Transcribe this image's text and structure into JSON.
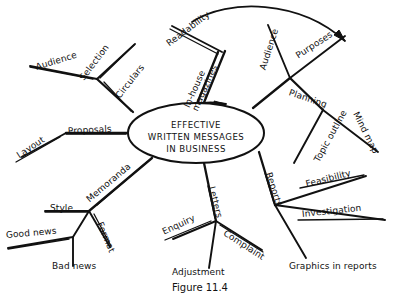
{
  "figure": {
    "caption": "Figure 11.4",
    "caption_x": 172,
    "caption_y": 282
  },
  "center": {
    "name": "center-node",
    "line1": "EFFECTIVE",
    "line2": "WRITTEN MESSAGES",
    "line3": "IN BUSINESS",
    "cx": 196,
    "cy": 133,
    "rx": 68,
    "ry": 30
  },
  "colors": {
    "ink": "#111111",
    "background": "#ffffff"
  },
  "branches": [
    {
      "id": "circulars",
      "label": "Circulars",
      "x": 118,
      "y": 93,
      "rot": -52,
      "underline": true,
      "children": [
        {
          "id": "audience-circulars",
          "label": "Audience",
          "x": 36,
          "y": 63,
          "rot": -17,
          "underline": true
        },
        {
          "id": "selection",
          "label": "Selection",
          "x": 82,
          "y": 75,
          "rot": -53,
          "underline": true
        }
      ]
    },
    {
      "id": "proposals",
      "label": "Proposals",
      "x": 68,
      "y": 127,
      "rot": -3,
      "underline": true,
      "children": [
        {
          "id": "layout",
          "label": "Layout",
          "x": 18,
          "y": 152,
          "rot": -34,
          "underline": true
        }
      ]
    },
    {
      "id": "memoranda",
      "label": "Memoranda",
      "x": 88,
      "y": 196,
      "rot": -40,
      "underline": true,
      "children": [
        {
          "id": "style",
          "label": "Style",
          "x": 50,
          "y": 204,
          "rot": 0,
          "underline": true
        },
        {
          "id": "format",
          "label": "Format",
          "x": 99,
          "y": 218,
          "rot": 67,
          "underline": true
        },
        {
          "id": "good-news",
          "label": "Good news",
          "x": 6,
          "y": 231,
          "rot": -5,
          "underline": true
        },
        {
          "id": "bad-news",
          "label": "Bad news",
          "x": 52,
          "y": 262,
          "rot": 0,
          "underline": false
        }
      ]
    },
    {
      "id": "letters",
      "label": "Letters",
      "x": 211,
      "y": 182,
      "rot": 76,
      "underline": true,
      "children": [
        {
          "id": "enquiry",
          "label": "Enquiry",
          "x": 163,
          "y": 228,
          "rot": -25,
          "underline": true
        },
        {
          "id": "complaint",
          "label": "Complaint",
          "x": 224,
          "y": 228,
          "rot": 33,
          "underline": true
        },
        {
          "id": "adjustment",
          "label": "Adjustment",
          "x": 172,
          "y": 268,
          "rot": 0,
          "underline": false
        }
      ]
    },
    {
      "id": "reports",
      "label": "Reports",
      "x": 268,
      "y": 168,
      "rot": 72,
      "underline": true,
      "children": [
        {
          "id": "feasibility",
          "label": "Feasibility",
          "x": 306,
          "y": 180,
          "rot": -14,
          "underline": true
        },
        {
          "id": "investigation",
          "label": "Investigation",
          "x": 302,
          "y": 210,
          "rot": -6,
          "underline": true
        },
        {
          "id": "graphics-in-reports",
          "label": "Graphics in reports",
          "x": 289,
          "y": 262,
          "rot": 0,
          "underline": false
        }
      ]
    },
    {
      "id": "planning",
      "label": "Planning",
      "x": 289,
      "y": 88,
      "rot": 19,
      "underline": false,
      "children": [
        {
          "id": "audience-planning",
          "label": "Audience",
          "x": 263,
          "y": 65,
          "rot": -72,
          "underline": false
        },
        {
          "id": "purposes",
          "label": "Purposes",
          "x": 297,
          "y": 52,
          "rot": -33,
          "underline": false
        },
        {
          "id": "topic-outline",
          "label": "Topic outline",
          "x": 317,
          "y": 157,
          "rot": -61,
          "underline": false
        },
        {
          "id": "mind-map",
          "label": "Mind map",
          "x": 355,
          "y": 108,
          "rot": 63,
          "underline": false
        }
      ]
    },
    {
      "id": "in-house-magazines",
      "label": "In-house magazines",
      "label_line1": "In-house",
      "label_line2": "magazines",
      "x": 191,
      "y": 100,
      "rot": -66,
      "underline": false,
      "children": [
        {
          "id": "readability",
          "label": "Readability",
          "x": 168,
          "y": 40,
          "rot": -37,
          "underline": true
        }
      ]
    }
  ],
  "arrows": [
    {
      "id": "top-sweep-arrow",
      "description": "curved arrow arcing over the top from readability toward purposes"
    },
    {
      "id": "ellipse-inlet-arrow",
      "description": "arrowhead entering top of central ellipse"
    }
  ]
}
